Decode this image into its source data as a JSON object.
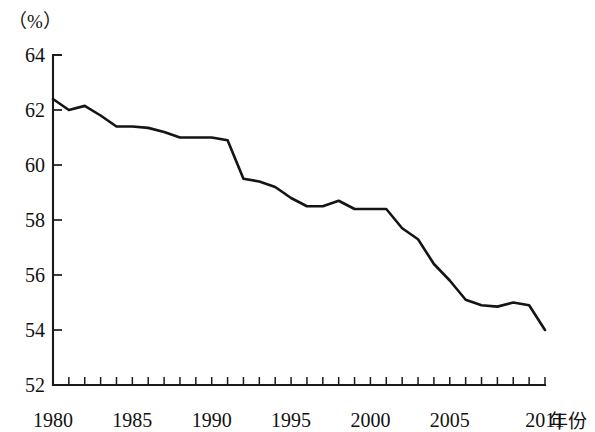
{
  "chart_data": {
    "type": "line",
    "title": "",
    "subtitle": "",
    "xlabel": "年份",
    "ylabel": "",
    "y_unit_label": "（%）",
    "xlim": [
      1980,
      2011
    ],
    "ylim": [
      52,
      64
    ],
    "y_ticks": [
      52,
      54,
      56,
      58,
      60,
      62,
      64
    ],
    "y_tick_labels": [
      "52",
      "54",
      "56",
      "58",
      "60",
      "62",
      "64"
    ],
    "x_ticks": [
      1980,
      1981,
      1982,
      1983,
      1984,
      1985,
      1986,
      1987,
      1988,
      1989,
      1990,
      1991,
      1992,
      1993,
      1994,
      1995,
      1996,
      1997,
      1998,
      1999,
      2000,
      2001,
      2002,
      2003,
      2004,
      2005,
      2006,
      2007,
      2008,
      2009,
      2010,
      2011
    ],
    "x_tick_labels_shown": [
      "1980",
      "1985",
      "1990",
      "1995",
      "2000",
      "2005",
      "2011"
    ],
    "x_labeled_ticks": [
      1980,
      1985,
      1990,
      1995,
      2000,
      2005,
      2011
    ],
    "grid": false,
    "legend": false,
    "legend_position": "none",
    "line_color": "#141414",
    "axis_color": "#1a1a1a",
    "background_color": "#ffffff",
    "x": [
      1980,
      1981,
      1982,
      1983,
      1984,
      1985,
      1986,
      1987,
      1988,
      1989,
      1990,
      1991,
      1992,
      1993,
      1994,
      1995,
      1996,
      1997,
      1998,
      1999,
      2000,
      2001,
      2002,
      2003,
      2004,
      2005,
      2006,
      2007,
      2008,
      2009,
      2010,
      2011
    ],
    "values": [
      62.4,
      62.0,
      62.15,
      61.8,
      61.4,
      61.4,
      61.35,
      61.2,
      61.0,
      61.0,
      61.0,
      60.9,
      59.5,
      59.4,
      59.2,
      58.8,
      58.5,
      58.5,
      58.7,
      58.4,
      58.4,
      58.4,
      57.7,
      57.3,
      56.4,
      55.8,
      55.1,
      54.9,
      54.85,
      55.0,
      54.9,
      54.0
    ],
    "series": [
      {
        "name": "",
        "values": [
          62.4,
          62.0,
          62.15,
          61.8,
          61.4,
          61.4,
          61.35,
          61.2,
          61.0,
          61.0,
          61.0,
          60.9,
          59.5,
          59.4,
          59.2,
          58.8,
          58.5,
          58.5,
          58.7,
          58.4,
          58.4,
          58.4,
          57.7,
          57.3,
          56.4,
          55.8,
          55.1,
          54.9,
          54.85,
          55.0,
          54.9,
          54.0
        ]
      }
    ]
  }
}
